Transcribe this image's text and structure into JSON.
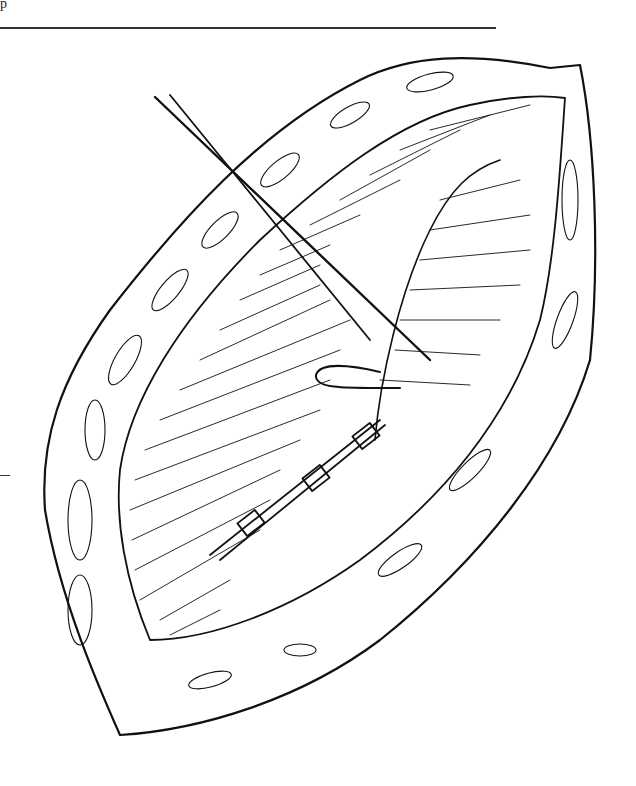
{
  "page": {
    "header_fragment": "p",
    "figure": {
      "type": "line-drawing",
      "subject": "surgical-incision-suture-illustration",
      "colors": {
        "ink": "#111111",
        "paper": "#ffffff",
        "rule": "#333333"
      }
    }
  }
}
